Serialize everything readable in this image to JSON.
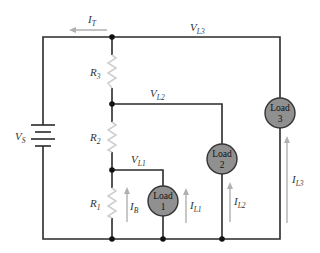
{
  "diagram": {
    "type": "circuit-schematic",
    "source": {
      "label": "V",
      "sub": "S"
    },
    "resistors": [
      {
        "id": "R1",
        "label": "R",
        "sub": "1"
      },
      {
        "id": "R2",
        "label": "R",
        "sub": "2"
      },
      {
        "id": "R3",
        "label": "R",
        "sub": "3"
      }
    ],
    "loads": [
      {
        "id": "load1",
        "line1": "Load",
        "line2": "1"
      },
      {
        "id": "load2",
        "line1": "Load",
        "line2": "2"
      },
      {
        "id": "load3",
        "line1": "Load",
        "line2": "3"
      }
    ],
    "voltages": [
      {
        "id": "VL1",
        "label": "V",
        "sub": "L1"
      },
      {
        "id": "VL2",
        "label": "V",
        "sub": "L2"
      },
      {
        "id": "VL3",
        "label": "V",
        "sub": "L3"
      }
    ],
    "currents": [
      {
        "id": "IT",
        "label": "I",
        "sub": "T"
      },
      {
        "id": "IB",
        "label": "I",
        "sub": "B"
      },
      {
        "id": "IL1",
        "label": "I",
        "sub": "L1"
      },
      {
        "id": "IL2",
        "label": "I",
        "sub": "L2"
      },
      {
        "id": "IL3",
        "label": "I",
        "sub": "L3"
      }
    ],
    "colors": {
      "wire": "#2a2a2a",
      "resistor": "#d0d0d0",
      "arrow": "#b0b0b0",
      "load_fill": "#909090"
    }
  }
}
